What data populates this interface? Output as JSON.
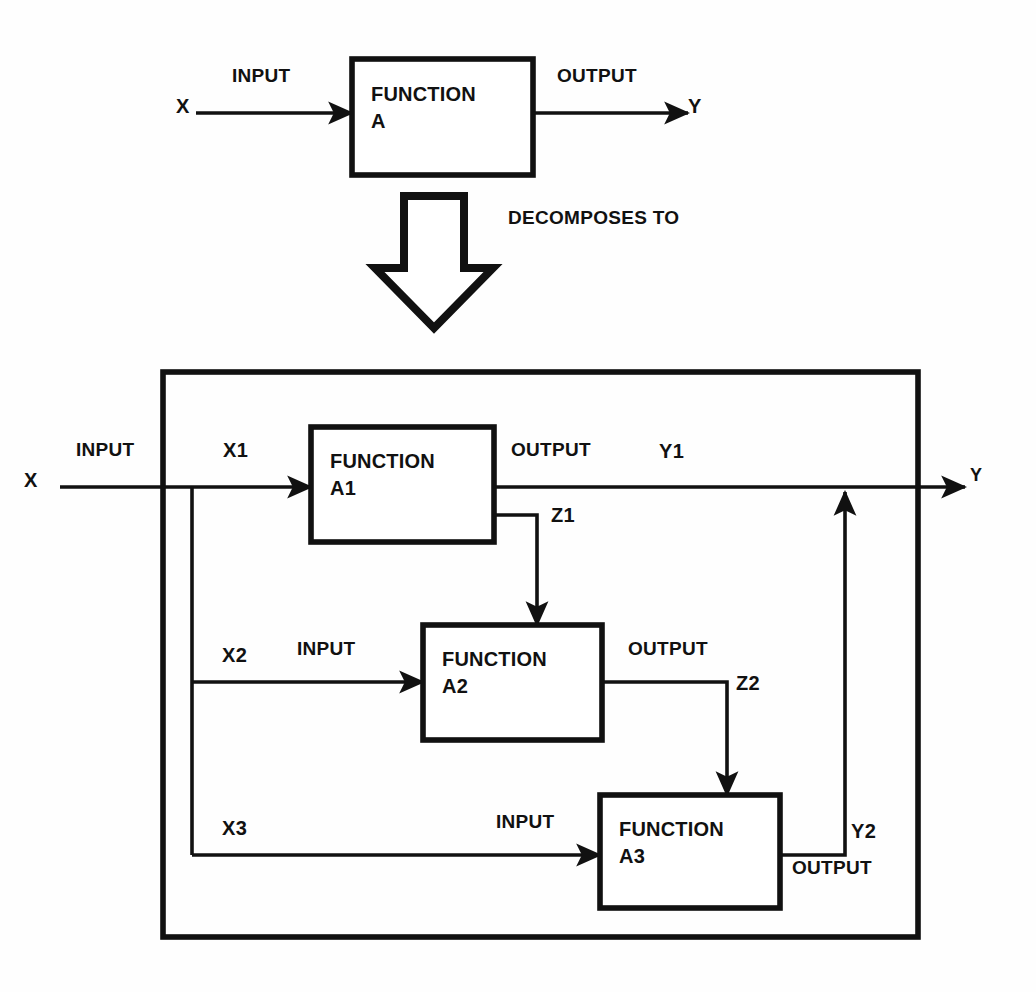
{
  "figure": {
    "type": "functional-decomposition-block-diagram",
    "relation_label": "DECOMPOSES TO"
  },
  "top_diagram": {
    "box": {
      "title_line1": "FUNCTION",
      "title_line2": "A"
    },
    "input_signal_label": "INPUT",
    "input_var": "X",
    "output_signal_label": "OUTPUT",
    "output_var": "Y"
  },
  "bottom_diagram": {
    "input_signal_label": "INPUT",
    "input_var": "X",
    "output_var": "Y",
    "branches": [
      {
        "var": "X1"
      },
      {
        "var": "X2",
        "signal_label": "INPUT"
      },
      {
        "var": "X3",
        "signal_label": "INPUT"
      }
    ],
    "blocks": [
      {
        "title_line1": "FUNCTION",
        "title_line2": "A1",
        "output_signal_label": "OUTPUT",
        "output_var": "Y1",
        "intermediate_var": "Z1"
      },
      {
        "title_line1": "FUNCTION",
        "title_line2": "A2",
        "output_signal_label": "OUTPUT",
        "intermediate_var": "Z2"
      },
      {
        "title_line1": "FUNCTION",
        "title_line2": "A3",
        "output_signal_label": "OUTPUT",
        "output_var": "Y2"
      }
    ]
  },
  "colors": {
    "ink": "#111111",
    "paper": "#fefefe"
  }
}
